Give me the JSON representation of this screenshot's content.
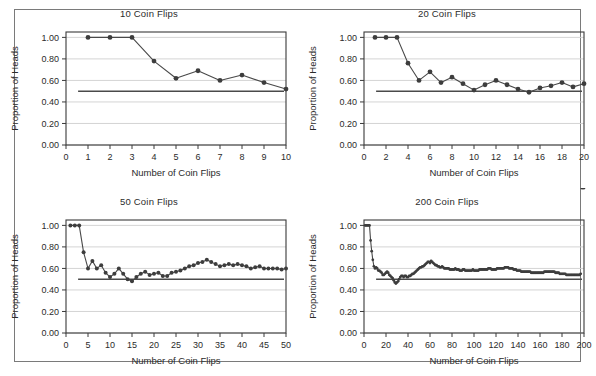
{
  "page": {
    "background_color": "#ffffff",
    "frame_color": "#7a7a7a"
  },
  "style": {
    "line_color": "#494949",
    "marker_color": "#3d3d3d",
    "grid_color": "#cfcfcf",
    "axis_color": "#3a3a3a",
    "reference_line_color": "#4a4a4a"
  },
  "common": {
    "xlabel": "Number of Coin Flips",
    "ylabel": "Proportion of Heads",
    "yticks": [
      "0.00",
      "0.20",
      "0.40",
      "0.60",
      "0.80",
      "1.00"
    ],
    "reference_value": 0.5
  },
  "chart_data": [
    {
      "type": "line",
      "title": "10 Coin Flips",
      "xlabel": "Number of Coin Flips",
      "ylabel": "Proportion of Heads",
      "xlim": [
        0,
        10
      ],
      "ylim": [
        0.0,
        1.05
      ],
      "xticks": [
        0,
        1,
        2,
        3,
        4,
        5,
        6,
        7,
        8,
        9,
        10
      ],
      "xticklabels": [
        "0",
        "1",
        "2",
        "3",
        "4",
        "5",
        "6",
        "7",
        "8",
        "9",
        "10"
      ],
      "yticks": [
        0.0,
        0.2,
        0.4,
        0.6,
        0.8,
        1.0
      ],
      "yticklabels": [
        "0.00",
        "0.20",
        "0.40",
        "0.60",
        "0.80",
        "1.00"
      ],
      "grid": true,
      "legend": "none",
      "reference_line": 0.5,
      "markers": true,
      "x": [
        1,
        2,
        3,
        4,
        5,
        6,
        7,
        8,
        9,
        10
      ],
      "values": [
        1.0,
        1.0,
        1.0,
        0.78,
        0.62,
        0.69,
        0.6,
        0.65,
        0.58,
        0.52
      ]
    },
    {
      "type": "line",
      "title": "20 Coin Flips",
      "xlabel": "Number of Coin Flips",
      "ylabel": "Proportion of Heads",
      "xlim": [
        0,
        20
      ],
      "ylim": [
        0.0,
        1.05
      ],
      "xticks": [
        0,
        2,
        4,
        6,
        8,
        10,
        12,
        14,
        16,
        18,
        20
      ],
      "xticklabels": [
        "0",
        "2",
        "4",
        "6",
        "8",
        "10",
        "12",
        "14",
        "16",
        "18",
        "20"
      ],
      "yticks": [
        0.0,
        0.2,
        0.4,
        0.6,
        0.8,
        1.0
      ],
      "yticklabels": [
        "0.00",
        "0.20",
        "0.40",
        "0.60",
        "0.80",
        "1.00"
      ],
      "grid": true,
      "legend": "none",
      "reference_line": 0.5,
      "markers": true,
      "x": [
        1,
        2,
        3,
        4,
        5,
        6,
        7,
        8,
        9,
        10,
        11,
        12,
        13,
        14,
        15,
        16,
        17,
        18,
        19,
        20
      ],
      "values": [
        1.0,
        1.0,
        1.0,
        0.76,
        0.6,
        0.68,
        0.58,
        0.63,
        0.57,
        0.51,
        0.56,
        0.6,
        0.56,
        0.52,
        0.49,
        0.53,
        0.55,
        0.58,
        0.54,
        0.57
      ]
    },
    {
      "type": "line",
      "title": "50 Coin Flips",
      "xlabel": "Number of Coin Flips",
      "ylabel": "Proportion of Heads",
      "xlim": [
        0,
        50
      ],
      "ylim": [
        0.0,
        1.05
      ],
      "xticks": [
        0,
        5,
        10,
        15,
        20,
        25,
        30,
        35,
        40,
        45,
        50
      ],
      "xticklabels": [
        "0",
        "5",
        "10",
        "15",
        "20",
        "25",
        "30",
        "35",
        "40",
        "45",
        "50"
      ],
      "yticks": [
        0.0,
        0.2,
        0.4,
        0.6,
        0.8,
        1.0
      ],
      "yticklabels": [
        "0.00",
        "0.20",
        "0.40",
        "0.60",
        "0.80",
        "1.00"
      ],
      "grid": true,
      "legend": "none",
      "reference_line": 0.5,
      "markers": true,
      "x": [
        1,
        2,
        3,
        4,
        5,
        6,
        7,
        8,
        9,
        10,
        11,
        12,
        13,
        14,
        15,
        16,
        17,
        18,
        19,
        20,
        21,
        22,
        23,
        24,
        25,
        26,
        27,
        28,
        29,
        30,
        31,
        32,
        33,
        34,
        35,
        36,
        37,
        38,
        39,
        40,
        41,
        42,
        43,
        44,
        45,
        46,
        47,
        48,
        49,
        50
      ],
      "values": [
        1.0,
        1.0,
        1.0,
        0.75,
        0.6,
        0.67,
        0.6,
        0.63,
        0.56,
        0.52,
        0.55,
        0.6,
        0.55,
        0.5,
        0.48,
        0.52,
        0.55,
        0.57,
        0.54,
        0.55,
        0.56,
        0.53,
        0.53,
        0.56,
        0.57,
        0.58,
        0.6,
        0.62,
        0.63,
        0.65,
        0.66,
        0.68,
        0.66,
        0.64,
        0.62,
        0.63,
        0.64,
        0.63,
        0.64,
        0.63,
        0.62,
        0.6,
        0.61,
        0.62,
        0.6,
        0.6,
        0.6,
        0.6,
        0.59,
        0.6
      ]
    },
    {
      "type": "line",
      "title": "200 Coin Flips",
      "xlabel": "Number of Coin Flips",
      "ylabel": "Proportion of Heads",
      "xlim": [
        0,
        200
      ],
      "ylim": [
        0.0,
        1.05
      ],
      "xticks": [
        0,
        20,
        40,
        60,
        80,
        100,
        120,
        140,
        160,
        180,
        200
      ],
      "xticklabels": [
        "0",
        "20",
        "40",
        "60",
        "80",
        "100",
        "120",
        "140",
        "160",
        "180",
        "200"
      ],
      "yticks": [
        0.0,
        0.2,
        0.4,
        0.6,
        0.8,
        1.0
      ],
      "yticklabels": [
        "0.00",
        "0.20",
        "0.40",
        "0.60",
        "0.80",
        "1.00"
      ],
      "grid": true,
      "legend": "none",
      "reference_line": 0.5,
      "markers": true,
      "x": [
        1,
        2,
        3,
        4,
        5,
        6,
        7,
        8,
        9,
        10,
        11,
        12,
        13,
        14,
        15,
        16,
        17,
        18,
        19,
        20,
        21,
        22,
        23,
        24,
        25,
        26,
        27,
        28,
        29,
        30,
        31,
        32,
        33,
        34,
        35,
        36,
        37,
        38,
        39,
        40,
        41,
        42,
        43,
        44,
        45,
        46,
        47,
        48,
        49,
        50,
        51,
        52,
        53,
        54,
        55,
        56,
        57,
        58,
        59,
        60,
        61,
        62,
        63,
        64,
        65,
        66,
        67,
        68,
        69,
        70,
        71,
        72,
        73,
        74,
        75,
        76,
        77,
        78,
        79,
        80,
        81,
        82,
        83,
        84,
        85,
        86,
        87,
        88,
        89,
        90,
        91,
        92,
        93,
        94,
        95,
        96,
        97,
        98,
        99,
        100,
        101,
        102,
        103,
        104,
        105,
        106,
        107,
        108,
        109,
        110,
        111,
        112,
        113,
        114,
        115,
        116,
        117,
        118,
        119,
        120,
        121,
        122,
        123,
        124,
        125,
        126,
        127,
        128,
        129,
        130,
        131,
        132,
        133,
        134,
        135,
        136,
        137,
        138,
        139,
        140,
        141,
        142,
        143,
        144,
        145,
        146,
        147,
        148,
        149,
        150,
        151,
        152,
        153,
        154,
        155,
        156,
        157,
        158,
        159,
        160,
        161,
        162,
        163,
        164,
        165,
        166,
        167,
        168,
        169,
        170,
        171,
        172,
        173,
        174,
        175,
        176,
        177,
        178,
        179,
        180,
        181,
        182,
        183,
        184,
        185,
        186,
        187,
        188,
        189,
        190,
        191,
        192,
        193,
        194,
        195,
        196,
        197,
        198,
        199,
        200
      ],
      "values": [
        1.0,
        1.0,
        1.0,
        1.0,
        1.0,
        0.86,
        0.76,
        0.68,
        0.62,
        0.6,
        0.61,
        0.6,
        0.58,
        0.58,
        0.57,
        0.56,
        0.54,
        0.54,
        0.55,
        0.56,
        0.57,
        0.56,
        0.54,
        0.53,
        0.52,
        0.51,
        0.49,
        0.47,
        0.46,
        0.47,
        0.48,
        0.5,
        0.52,
        0.53,
        0.53,
        0.52,
        0.53,
        0.53,
        0.52,
        0.52,
        0.53,
        0.53,
        0.54,
        0.55,
        0.55,
        0.56,
        0.57,
        0.58,
        0.59,
        0.6,
        0.61,
        0.61,
        0.62,
        0.62,
        0.63,
        0.64,
        0.65,
        0.66,
        0.66,
        0.65,
        0.67,
        0.66,
        0.65,
        0.64,
        0.63,
        0.63,
        0.62,
        0.62,
        0.61,
        0.61,
        0.62,
        0.61,
        0.6,
        0.6,
        0.6,
        0.6,
        0.6,
        0.59,
        0.59,
        0.59,
        0.59,
        0.59,
        0.6,
        0.59,
        0.59,
        0.59,
        0.58,
        0.58,
        0.58,
        0.59,
        0.59,
        0.58,
        0.58,
        0.58,
        0.58,
        0.58,
        0.58,
        0.58,
        0.59,
        0.58,
        0.58,
        0.58,
        0.58,
        0.58,
        0.59,
        0.59,
        0.59,
        0.59,
        0.59,
        0.59,
        0.59,
        0.59,
        0.6,
        0.6,
        0.6,
        0.59,
        0.59,
        0.59,
        0.59,
        0.59,
        0.6,
        0.6,
        0.6,
        0.6,
        0.6,
        0.6,
        0.6,
        0.61,
        0.61,
        0.61,
        0.61,
        0.6,
        0.6,
        0.6,
        0.6,
        0.59,
        0.59,
        0.59,
        0.58,
        0.58,
        0.58,
        0.58,
        0.57,
        0.57,
        0.57,
        0.57,
        0.57,
        0.57,
        0.57,
        0.57,
        0.57,
        0.56,
        0.56,
        0.56,
        0.56,
        0.56,
        0.56,
        0.56,
        0.56,
        0.56,
        0.56,
        0.56,
        0.56,
        0.57,
        0.57,
        0.57,
        0.57,
        0.57,
        0.57,
        0.57,
        0.57,
        0.57,
        0.57,
        0.56,
        0.56,
        0.56,
        0.56,
        0.55,
        0.55,
        0.55,
        0.55,
        0.55,
        0.55,
        0.54,
        0.54,
        0.54,
        0.54,
        0.54,
        0.54,
        0.54,
        0.54,
        0.54,
        0.54,
        0.54,
        0.54,
        0.54,
        0.55
      ]
    }
  ]
}
